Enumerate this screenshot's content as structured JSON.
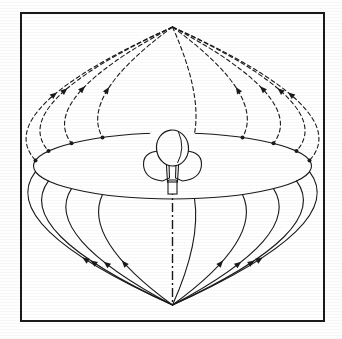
{
  "figure": {
    "domain_label": "Diagram",
    "background_color": "#ffffff",
    "ink_color": "#1a1a1a",
    "frame": {
      "x": 20,
      "y": 12,
      "width": 305,
      "height": 310,
      "stroke_width": 2,
      "color": "#1a1a1a"
    }
  },
  "sphere": {
    "center_x": 172.5,
    "center_y": 166,
    "radius_x": 139,
    "radius_y": 139,
    "north_pole": {
      "x": 172.5,
      "y": 27
    },
    "south_pole": {
      "x": 172.5,
      "y": 305
    },
    "equator": {
      "label": "equator",
      "center_x": 172.5,
      "center_y": 166,
      "radius_x": 139,
      "radius_y": 33,
      "stroke_width": 1.1,
      "style": "solid"
    },
    "outline": {
      "label": "sphere-silhouette",
      "visible": false,
      "stroke_width": 1.0
    }
  },
  "meridians": {
    "count": 9,
    "upper_style": "dashed",
    "lower_style": "solid",
    "dash_pattern": "4,3",
    "stroke_width": 1.1,
    "arrow_direction": "toward-north-pole",
    "longitudes_deg": [
      -80,
      -62,
      -42,
      -22,
      0,
      22,
      42,
      62,
      80
    ],
    "half_widths": [
      137,
      124,
      101,
      70,
      22,
      70,
      101,
      124,
      137
    ],
    "arrow_count_upper": 1,
    "arrow_count_lower": 1
  },
  "axis": {
    "label": "polar-axis-mast",
    "x": 172.5,
    "y_top": 186,
    "y_bottom": 305,
    "style": "dash-dot",
    "dash_pattern": "9,3,2,3",
    "stroke_width": 1.4
  },
  "antenna": {
    "label": "central-antenna",
    "center_x": 172.5,
    "center_y": 160,
    "reflector": {
      "label": "reflector-dish",
      "cx": 172.5,
      "cy": 148,
      "rx": 16,
      "ry": 18
    },
    "body": {
      "label": "antenna-body-horn",
      "width": 52,
      "height": 44
    },
    "mast_collar": {
      "label": "mast-collar",
      "cx": 172.5,
      "cy": 188,
      "width": 9,
      "height": 12
    }
  },
  "equator_nodes": {
    "label": "meridian-equator-intersections",
    "marker": "dot",
    "radius": 2.0,
    "count": 8
  }
}
